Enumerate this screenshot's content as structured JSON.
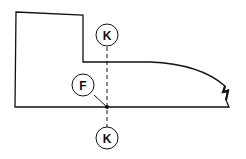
{
  "diagram": {
    "colors": {
      "stroke": "#111111",
      "background": "#ffffff"
    },
    "labels": {
      "top_marker": "K",
      "bottom_marker": "K",
      "point_marker": "F"
    },
    "elements": [
      {
        "type": "outline",
        "name": "profile-outline",
        "description": "stepped profile with curved right edge ending in rough edge"
      },
      {
        "type": "section-line",
        "name": "section-line-K-K",
        "style": "dashed",
        "orientation": "vertical"
      },
      {
        "type": "callout",
        "name": "marker-K-top",
        "label": "K"
      },
      {
        "type": "callout",
        "name": "marker-K-bottom",
        "label": "K"
      },
      {
        "type": "callout",
        "name": "marker-F",
        "label": "F",
        "points_to": "point on baseline at section line"
      }
    ]
  }
}
